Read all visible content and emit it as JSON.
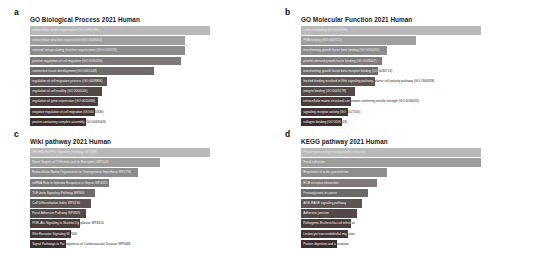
{
  "figure": {
    "background": "#ffffff",
    "panel_letters": [
      "a",
      "b",
      "c",
      "d"
    ]
  },
  "palette": {
    "rank_colors": [
      "#b9b9b9",
      "#9e9e9e",
      "#8d8d8d",
      "#7e7a7a",
      "#6f6a6a",
      "#5e5454",
      "#544747",
      "#4b3c3c",
      "#443434",
      "#3e2d2d"
    ],
    "label_color": "#ffffff",
    "title_color": "#1a1a1a"
  },
  "panels": {
    "a": {
      "letter": "a",
      "title": "GO Biological Process 2021 Human"
    },
    "b": {
      "letter": "b",
      "title": "GO Molecular Function 2021 Human"
    },
    "c": {
      "letter": "c",
      "title": "Wiki pathway 2021 Human"
    },
    "d": {
      "letter": "d",
      "title": "KEGG pathway 2021 Human"
    }
  },
  "chart_data": [
    {
      "type": "bar",
      "orientation": "horizontal",
      "panel": "a",
      "title": "GO Biological Process 2021 Human",
      "xlabel": "",
      "ylabel": "",
      "grid": false,
      "legend": false,
      "xlim": [
        0,
        100
      ],
      "categories": [
        "extracellular matrix organization (GO:0030198)",
        "extracellular structure organization (GO:0043062)",
        "external encapsulating structure organization (GO:0045229)",
        "positive regulation of cell migration (GO:0030335)",
        "connective tissue development (GO:0061448)",
        "regulation of cell migration process (GO:0009894)",
        "regulation of cell motility (GO:2000145)",
        "regulation of gene expression (GO:0010468)",
        "negative regulation of cell migration (GO:0030336)",
        "protein-containing complex assembly (GO:0065003)"
      ],
      "values": [
        100,
        86,
        86,
        84,
        69,
        43,
        40,
        38,
        36,
        31
      ]
    },
    {
      "type": "bar",
      "orientation": "horizontal",
      "panel": "b",
      "title": "GO Molecular Function 2021 Human",
      "xlabel": "",
      "ylabel": "",
      "grid": false,
      "legend": false,
      "xlim": [
        0,
        100
      ],
      "categories": [
        "cadherin binding (GO:0045296)",
        "RNA binding (GO:0003723)",
        "transforming growth factor beta binding (GO:0050431)",
        "platelet-derived growth factor binding (GO:0048407)",
        "transforming growth factor beta receptor binding (GO:0034713)",
        "frizzled binding involved in Wnt signaling pathway, planar cell polarity pathway (GO:1904928)",
        "integrin binding (GO:0005178)",
        "extracellular matrix structural constituent conferring tensile strength (GO:0030020)",
        "signaling receptor activity (GO:0017154)",
        "collagen binding (GO:0005518)"
      ],
      "values": [
        100,
        64,
        48,
        45,
        43,
        41,
        30,
        28,
        26,
        23
      ]
    },
    {
      "type": "bar",
      "orientation": "horizontal",
      "panel": "c",
      "title": "Wiki pathway 2021 Human",
      "xlabel": "",
      "ylabel": "",
      "grid": false,
      "legend": false,
      "xlim": [
        0,
        100
      ],
      "categories": [
        "VEGFA-VEGFR2 Signaling Pathway WP3888",
        "Novel Targets of TGF-beta and its Receptors WP3123",
        "Extracellular Matrix Organization in Osteogenesis Imperfecta WP4786",
        "miRNA Role in Immune Response in Sepsis WP4329",
        "TGF-beta Signaling Pathway WP366",
        "Cell Differentiation Index WP4336",
        "Focal Adhesion Pathway WP4925",
        "PI3K-Akt Signaling in Skeletal Dysplasias WP4816",
        "Wnt Receptor Signaling WP560",
        "Signal Pathways in Pathogenesis of Cardiovascular Disease WP5068"
      ],
      "values": [
        100,
        72,
        60,
        44,
        36,
        34,
        31,
        28,
        23,
        20
      ]
    },
    {
      "type": "bar",
      "orientation": "horizontal",
      "panel": "d",
      "title": "KEGG pathway 2021 Human",
      "xlabel": "",
      "ylabel": "",
      "grid": false,
      "legend": false,
      "xlim": [
        0,
        100
      ],
      "categories": [
        "Protein processing in endoplasmic reticulum",
        "Focal adhesion",
        "Regulation of actin cytoskeleton",
        "ECM-receptor interaction",
        "Proteoglycans in cancer",
        "AGE-RAGE signaling pathway",
        "Adherens junction",
        "Pathogenic Escherichia coli infection",
        "Leukocyte transendothelial migration",
        "Protein digestion and absorption"
      ],
      "values": [
        100,
        100,
        48,
        42,
        37,
        34,
        31,
        28,
        26,
        20
      ]
    }
  ]
}
